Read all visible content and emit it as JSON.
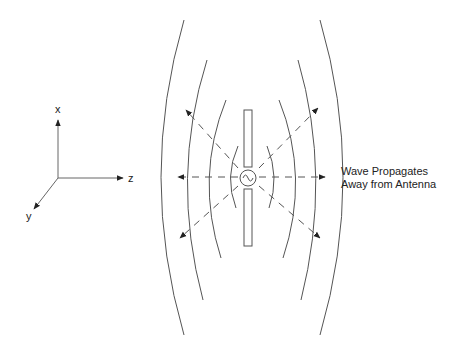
{
  "axes": {
    "x_label": "x",
    "y_label": "y",
    "z_label": "z"
  },
  "annotation": {
    "line1": "Wave Propagates",
    "line2": "Away from Antenna"
  },
  "colors": {
    "line": "#555555",
    "text": "#222222",
    "background": "#ffffff"
  }
}
